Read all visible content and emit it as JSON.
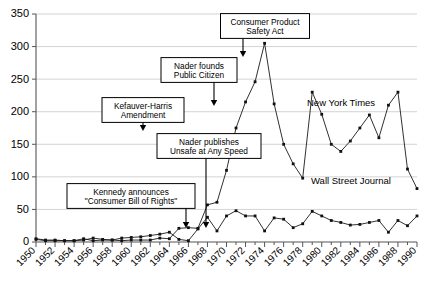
{
  "chart_data": {
    "type": "line",
    "title": "",
    "xlabel": "",
    "ylabel": "",
    "ylim": [
      0,
      350
    ],
    "ytick_step": 50,
    "yticks": [
      "0",
      "50",
      "100",
      "150",
      "200",
      "250",
      "300",
      "350"
    ],
    "xlim": [
      1950,
      1990
    ],
    "xticks": [
      "1950",
      "1952",
      "1954",
      "1956",
      "1958",
      "1960",
      "1962",
      "1964",
      "1966",
      "1968",
      "1970",
      "1972",
      "1974",
      "1976",
      "1978",
      "1980",
      "1982",
      "1984",
      "1986",
      "1988",
      "1990"
    ],
    "xtick_step": 2,
    "minor_xtick_step": 1,
    "grid": "horizontal",
    "legend_position": "inline-labels",
    "x": [
      1950,
      1951,
      1952,
      1953,
      1954,
      1955,
      1956,
      1957,
      1958,
      1959,
      1960,
      1961,
      1962,
      1963,
      1964,
      1965,
      1966,
      1967,
      1968,
      1969,
      1970,
      1971,
      1972,
      1973,
      1974,
      1975,
      1976,
      1977,
      1978,
      1979,
      1980,
      1981,
      1982,
      1983,
      1984,
      1985,
      1986,
      1987,
      1988,
      1989,
      1990
    ],
    "series": [
      {
        "name": "New York Times",
        "color": "#111111",
        "values": [
          5,
          3,
          3,
          2,
          2,
          3,
          6,
          4,
          3,
          2,
          3,
          3,
          3,
          6,
          5,
          21,
          22,
          21,
          57,
          61,
          110,
          175,
          215,
          246,
          305,
          212,
          150,
          120,
          98,
          230,
          196,
          150,
          139,
          155,
          175,
          195,
          160,
          210,
          230,
          112,
          82
        ]
      },
      {
        "name": "Wall Street Journal",
        "color": "#111111",
        "values": [
          4,
          2,
          2,
          2,
          2,
          5,
          2,
          3,
          3,
          6,
          7,
          8,
          10,
          12,
          15,
          4,
          2,
          20,
          38,
          17,
          40,
          48,
          40,
          40,
          17,
          37,
          35,
          22,
          28,
          47,
          40,
          33,
          30,
          26,
          27,
          30,
          33,
          15,
          33,
          25,
          40
        ]
      }
    ],
    "annotations": [
      {
        "id": "kennedy",
        "lines": [
          "Kennedy announces",
          "\"Consumer Bill of Rights\""
        ],
        "target_year": 1963,
        "target_value": 6
      },
      {
        "id": "nader-publishes",
        "lines": [
          "Nader publishes",
          "Unsafe at Any Speed"
        ],
        "target_year": 1965,
        "target_value": 21
      },
      {
        "id": "kefauver-harris",
        "lines": [
          "Kefauver-Harris",
          "Amendment"
        ],
        "target_year": 1962,
        "target_value": 10
      },
      {
        "id": "nader-founds",
        "lines": [
          "Nader founds",
          "Public Citizen"
        ],
        "target_year": 1971,
        "target_value": 175
      },
      {
        "id": "cpsa",
        "lines": [
          "Consumer Product",
          "Safety Act"
        ],
        "target_year": 1972,
        "target_value": 215
      }
    ],
    "series_labels": [
      {
        "text": "New York Times",
        "series": "New York Times"
      },
      {
        "text": "Wall Street Journal",
        "series": "Wall Street Journal"
      }
    ]
  }
}
